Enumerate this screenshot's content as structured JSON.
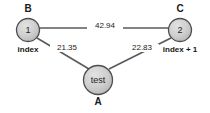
{
  "diagram": {
    "type": "weighted-undirected-graph",
    "background_color": "#ffffff",
    "node_fill_color": "#c9c9c9",
    "node_stroke_color": "#4d4d4d",
    "edge_color": "#5a5a5a",
    "text_color": "#1a1a1a",
    "nodes": [
      {
        "key": "b",
        "id_label": "B",
        "value": "1",
        "caption": "index",
        "cx": 28,
        "cy": 30,
        "r": 12
      },
      {
        "key": "c",
        "id_label": "C",
        "value": "2",
        "caption": "index + 1",
        "cx": 180,
        "cy": 30,
        "r": 12
      },
      {
        "key": "a",
        "id_label": "A",
        "value": "test",
        "caption": "",
        "cx": 98,
        "cy": 80,
        "r": 15
      }
    ],
    "edges": [
      {
        "key": "b-c",
        "from": "b",
        "to": "c",
        "weight": "42.94",
        "x1": 40,
        "y1": 28,
        "x2": 168,
        "y2": 28,
        "label_x": 103,
        "label_y": 25
      },
      {
        "key": "b-a",
        "from": "b",
        "to": "a",
        "weight": "21.35",
        "x1": 37,
        "y1": 38,
        "x2": 89,
        "y2": 69,
        "label_x": 66,
        "label_y": 47
      },
      {
        "key": "c-a",
        "from": "c",
        "to": "a",
        "weight": "22.83",
        "x1": 171,
        "y1": 38,
        "x2": 109,
        "y2": 69,
        "label_x": 140,
        "label_y": 47
      }
    ]
  }
}
